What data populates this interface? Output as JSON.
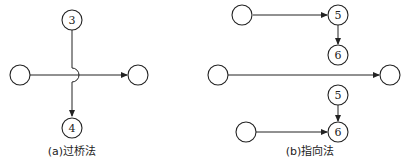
{
  "panel_a": {
    "caption": "(a)过桥法",
    "nodes": {
      "top": "3",
      "bottom": "4",
      "left": "",
      "right": ""
    }
  },
  "panel_b": {
    "caption": "(b)指向法",
    "nodes": {
      "top_left": "",
      "top_5": "5",
      "top_6": "6",
      "mid_left": "",
      "mid_right": "",
      "bot_5": "5",
      "bot_6": "6",
      "bot_left": ""
    }
  }
}
